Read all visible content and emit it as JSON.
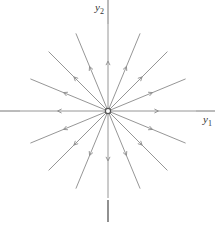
{
  "diagram": {
    "type": "phase-portrait",
    "center": {
      "x": 108,
      "y": 111
    },
    "axes": {
      "x_label": {
        "base": "y",
        "sub": "1"
      },
      "y_label": {
        "base": "y",
        "sub": "2"
      }
    },
    "ray_count": 16,
    "ray_length": 84,
    "arrow_direction": "outward",
    "colors": {
      "line": "#8a8a8a",
      "axis": "#777777",
      "origin_fill": "#ffffff",
      "origin_stroke": "#555555"
    }
  }
}
